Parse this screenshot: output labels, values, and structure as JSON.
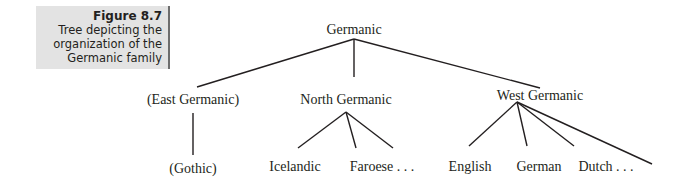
{
  "caption": {
    "figure_label": "Figure 8.7",
    "description": "Tree depicting the organization of the Germanic family"
  },
  "tree": {
    "root": "Germanic",
    "branches": [
      {
        "label": "(East Germanic)",
        "children": [
          "(Gothic)"
        ]
      },
      {
        "label": "North Germanic",
        "children": [
          "Icelandic",
          "Faroese . . ."
        ]
      },
      {
        "label": "West Germanic",
        "children": [
          "English",
          "German",
          "Dutch . . ."
        ]
      }
    ]
  },
  "colors": {
    "line": "#231f20",
    "caption_bg": "#e3e3e3",
    "caption_rule": "#6d6d6d"
  }
}
